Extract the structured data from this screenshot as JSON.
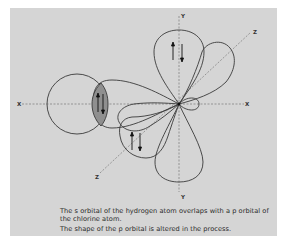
{
  "diagram": {
    "axes": {
      "x_left_label": "X",
      "x_right_label": "X",
      "y_top_label": "Y",
      "y_bottom_label": "Y",
      "z_top_label": "Z",
      "z_bottom_label": "Z"
    },
    "elements": [
      {
        "id": "hydrogen-s-orbital",
        "shape": "circle"
      },
      {
        "id": "chlorine-p-orbital-x",
        "shape": "lobe",
        "note": "distorted, overlaps with s orbital"
      },
      {
        "id": "chlorine-p-orbital-y",
        "shape": "lobe pair"
      },
      {
        "id": "chlorine-p-orbital-z",
        "shape": "lobe pair"
      },
      {
        "id": "overlap-region",
        "shape": "lens",
        "fill": "#8a8a8a"
      }
    ],
    "electron_pairs": [
      "overlap-region",
      "y-upper-lobe",
      "z-lower-lobe"
    ],
    "colors": {
      "panel": "#d5d5d5",
      "outline": "#3a3a3a",
      "overlap_fill": "#8f8f8f",
      "axis": "#6a6a6a"
    }
  },
  "caption": {
    "line1": "The s orbital of the hydrogen atom overlaps with a p orbital of the chlorine atom.",
    "line2": "The shape of the p orbital is altered in the process."
  }
}
